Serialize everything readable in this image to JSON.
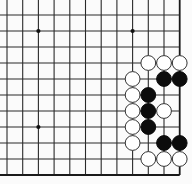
{
  "game": "go",
  "view": "board-corner-fragment",
  "board": {
    "visible_columns": 12,
    "visible_rows": 11,
    "edges_shown": [
      "right",
      "bottom"
    ],
    "colors": {
      "background": "#fbfbfb",
      "lines": "#2a2a2a",
      "black": "#0c0c0c",
      "white": "#ffffff"
    },
    "star_points": [
      {
        "col": 2,
        "row": 1
      },
      {
        "col": 8,
        "row": 1
      },
      {
        "col": 2,
        "row": 7
      }
    ],
    "stones": [
      {
        "color": "white",
        "col": 9,
        "row": 3
      },
      {
        "color": "white",
        "col": 10,
        "row": 3
      },
      {
        "color": "white",
        "col": 11,
        "row": 3
      },
      {
        "color": "white",
        "col": 8,
        "row": 4
      },
      {
        "color": "black",
        "col": 10,
        "row": 4
      },
      {
        "color": "black",
        "col": 11,
        "row": 4
      },
      {
        "color": "white",
        "col": 8,
        "row": 5
      },
      {
        "color": "black",
        "col": 9,
        "row": 5
      },
      {
        "color": "white",
        "col": 8,
        "row": 6
      },
      {
        "color": "black",
        "col": 9,
        "row": 6
      },
      {
        "color": "white",
        "col": 10,
        "row": 6
      },
      {
        "color": "white",
        "col": 8,
        "row": 7
      },
      {
        "color": "black",
        "col": 9,
        "row": 7
      },
      {
        "color": "white",
        "col": 8,
        "row": 8
      },
      {
        "color": "black",
        "col": 10,
        "row": 8
      },
      {
        "color": "black",
        "col": 11,
        "row": 8
      },
      {
        "color": "white",
        "col": 9,
        "row": 9
      },
      {
        "color": "white",
        "col": 10,
        "row": 9
      },
      {
        "color": "white",
        "col": 11,
        "row": 9
      }
    ]
  }
}
